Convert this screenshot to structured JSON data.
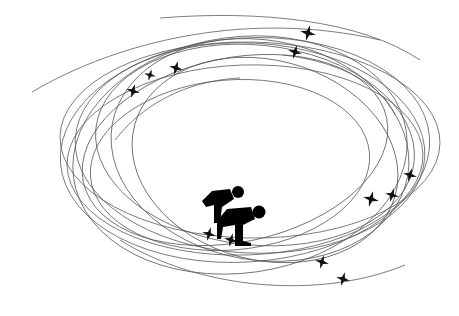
{
  "illustration": {
    "subject": "speed skaters on oval track with motion trails and sparkles",
    "background": "#ffffff",
    "trail_color": "#555555",
    "figure_color": "#000000",
    "skater_count": 2,
    "sparkle_count": 12,
    "sparkles": [
      {
        "x": 133,
        "y": 91,
        "s": 7
      },
      {
        "x": 150,
        "y": 75,
        "s": 6
      },
      {
        "x": 176,
        "y": 68,
        "s": 7
      },
      {
        "x": 308,
        "y": 33,
        "s": 8
      },
      {
        "x": 295,
        "y": 52,
        "s": 7
      },
      {
        "x": 371,
        "y": 199,
        "s": 8
      },
      {
        "x": 392,
        "y": 195,
        "s": 7
      },
      {
        "x": 410,
        "y": 175,
        "s": 7
      },
      {
        "x": 322,
        "y": 262,
        "s": 7
      },
      {
        "x": 343,
        "y": 279,
        "s": 7
      },
      {
        "x": 209,
        "y": 234,
        "s": 7
      },
      {
        "x": 231,
        "y": 240,
        "s": 7
      }
    ]
  }
}
